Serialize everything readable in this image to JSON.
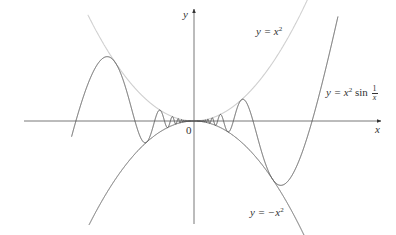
{
  "chart_data": {
    "type": "line",
    "title": "",
    "xlabel": "x",
    "ylabel": "y",
    "origin_label": "0",
    "grid": false,
    "legend": "inline curve labels",
    "pixel_mapping": {
      "origin_px": [
        194,
        121
      ],
      "x_scale_px_per_unit": 371,
      "y_scale_px_per_unit": 1298
    },
    "xlim": [
      -0.32,
      0.48
    ],
    "ylim": [
      -0.078,
      0.093
    ],
    "series": [
      {
        "name": "y = x^2",
        "label_text": "y = x²",
        "expr": "x^2",
        "color": "#cfcfcf",
        "x_range": [
          -0.286,
          0.33
        ]
      },
      {
        "name": "y = x^2 sin(1/x)",
        "label_text": "y = x² sin 1/x",
        "expr": "x^2*sin(1/x)",
        "color": "#555555",
        "x_range": [
          -0.33,
          0.388
        ]
      },
      {
        "name": "y = -x^2",
        "label_text": "y = −x²",
        "expr": "-x^2",
        "color": "#555555",
        "x_range": [
          -0.283,
          0.3
        ]
      }
    ],
    "key_points": [
      {
        "desc": "left zero crossing",
        "x": -0.318,
        "y": 0
      },
      {
        "desc": "right zero crossing",
        "x": 0.318,
        "y": 0
      },
      {
        "desc": "left local max",
        "x": -0.235,
        "y": 0.05
      },
      {
        "desc": "right local min",
        "x": 0.229,
        "y": -0.049
      }
    ]
  },
  "labels": {
    "y_axis": "y",
    "x_axis": "x",
    "origin": "0",
    "upper": {
      "lhs": "y = ",
      "var": "x",
      "exp": "2"
    },
    "main": {
      "lhs": "y = ",
      "var": "x",
      "exp": "2",
      "fn": " sin ",
      "num": "1",
      "den": "x"
    },
    "lower": {
      "lhs": "y = −",
      "var": "x",
      "exp": "2"
    }
  }
}
